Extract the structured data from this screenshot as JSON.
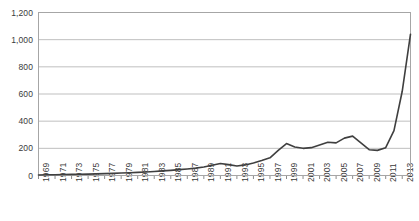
{
  "chart_data": {
    "type": "line",
    "title": "",
    "subtitle": "",
    "xlabel": "",
    "ylabel": "",
    "grid": "horizontal",
    "legend": "none",
    "xlim": [
      1969,
      2014
    ],
    "ylim": [
      0,
      1200
    ],
    "ytick_values": [
      0,
      200,
      400,
      600,
      800,
      1000,
      1200
    ],
    "ytick_labels": [
      "0",
      "200",
      "400",
      "600",
      "800",
      "1,000",
      "1,200"
    ],
    "xtick_labels": [
      "1969",
      "1971",
      "1973",
      "1975",
      "1977",
      "1979",
      "1981",
      "1983",
      "1985",
      "1987",
      "1989",
      "1991",
      "1993",
      "1995",
      "1997",
      "1999",
      "2001",
      "2003",
      "2005",
      "2007",
      "2009",
      "2011",
      "2013"
    ],
    "xtick_values": [
      1969,
      1971,
      1973,
      1975,
      1977,
      1979,
      1981,
      1983,
      1985,
      1987,
      1989,
      1991,
      1993,
      1995,
      1997,
      1999,
      2001,
      2003,
      2005,
      2007,
      2009,
      2011,
      2013
    ],
    "line_color": "#3f3f3f",
    "series": [
      {
        "name": "series-1",
        "x": [
          1969,
          1970,
          1971,
          1972,
          1973,
          1974,
          1975,
          1976,
          1977,
          1978,
          1979,
          1980,
          1981,
          1982,
          1983,
          1984,
          1985,
          1986,
          1987,
          1988,
          1989,
          1990,
          1991,
          1992,
          1993,
          1994,
          1995,
          1996,
          1997,
          1998,
          1999,
          2000,
          2001,
          2002,
          2003,
          2004,
          2005,
          2006,
          2007,
          2008,
          2009,
          2010,
          2011,
          2012,
          2013,
          2014
        ],
        "values": [
          4,
          5,
          6,
          7,
          8,
          9,
          10,
          12,
          14,
          16,
          18,
          20,
          23,
          26,
          30,
          34,
          38,
          43,
          48,
          54,
          62,
          75,
          88,
          80,
          70,
          78,
          92,
          110,
          130,
          185,
          235,
          210,
          200,
          205,
          225,
          245,
          240,
          275,
          290,
          240,
          190,
          185,
          205,
          330,
          620,
          1040
        ]
      }
    ]
  }
}
